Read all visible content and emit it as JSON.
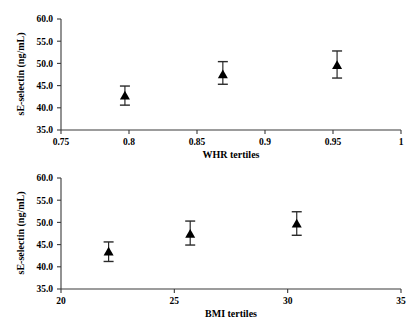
{
  "figure": {
    "background": "#ffffff",
    "axis_color": "#3a3a3a",
    "marker_color": "#000000",
    "error_bar_color": "#2a2a2a"
  },
  "chart_data": [
    {
      "id": "whr",
      "type": "scatter",
      "title": "",
      "xlabel": "WHR tertiles",
      "ylabel": "sE-selectin (ng/mL)",
      "xlim": [
        0.75,
        1
      ],
      "ylim": [
        35.0,
        60.0
      ],
      "grid": false,
      "legend": "none",
      "xticks": [
        0.75,
        0.8,
        0.85,
        0.9,
        0.95,
        1
      ],
      "xticklabels": [
        "0.75",
        "0.8",
        "0.85",
        "0.9",
        "0.95",
        "1"
      ],
      "yticks": [
        35.0,
        40.0,
        45.0,
        50.0,
        55.0,
        60.0
      ],
      "yticklabels": [
        "35.0",
        "40.0",
        "45.0",
        "50.0",
        "55.0",
        "60.0"
      ],
      "x": [
        0.797,
        0.869,
        0.953
      ],
      "values": [
        42.7,
        47.5,
        49.6
      ],
      "err_low": [
        40.6,
        45.3,
        46.7
      ],
      "err_high": [
        44.9,
        50.4,
        52.8
      ],
      "marker": "triangle-filled"
    },
    {
      "id": "bmi",
      "type": "scatter",
      "title": "",
      "xlabel": "BMI tertiles",
      "ylabel": "sE-selectin (ng/mL)",
      "xlim": [
        20,
        35
      ],
      "ylim": [
        35.0,
        60.0
      ],
      "grid": false,
      "legend": "none",
      "xticks": [
        20,
        25,
        30,
        35
      ],
      "xticklabels": [
        "20",
        "25",
        "30",
        "35"
      ],
      "yticks": [
        35.0,
        40.0,
        45.0,
        50.0,
        55.0,
        60.0
      ],
      "yticklabels": [
        "35.0",
        "40.0",
        "45.0",
        "50.0",
        "55.0",
        "60.0"
      ],
      "x": [
        22.1,
        25.7,
        30.4
      ],
      "values": [
        43.4,
        47.4,
        49.7
      ],
      "err_low": [
        41.2,
        44.9,
        47.1
      ],
      "err_high": [
        45.6,
        50.3,
        52.4
      ],
      "marker": "triangle-filled"
    }
  ]
}
